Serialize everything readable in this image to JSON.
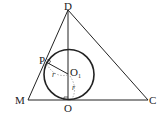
{
  "diagram": {
    "type": "geometry",
    "points": {
      "D": {
        "label": "D",
        "x": 68,
        "y": 10
      },
      "M": {
        "label": "M",
        "x": 28,
        "y": 100
      },
      "C": {
        "label": "C",
        "x": 148,
        "y": 100
      },
      "O": {
        "label": "O",
        "x": 68,
        "y": 100
      },
      "P": {
        "label": "P",
        "x": 46,
        "y": 62
      },
      "O1": {
        "label": "O",
        "subscript": "1",
        "x": 68,
        "y": 74
      }
    },
    "circle": {
      "center": "O1",
      "radius": 25
    },
    "segments": [
      [
        "D",
        "M"
      ],
      [
        "D",
        "C"
      ],
      [
        "M",
        "C"
      ],
      [
        "D",
        "O"
      ],
      [
        "P",
        "O1"
      ]
    ],
    "dashed_arcs": [
      {
        "label": "r",
        "from": "P",
        "to": "O1"
      },
      {
        "label": "r",
        "from": "O1",
        "to": "O"
      }
    ],
    "right_angles": [
      "P",
      "O"
    ],
    "radius_label": "r"
  }
}
